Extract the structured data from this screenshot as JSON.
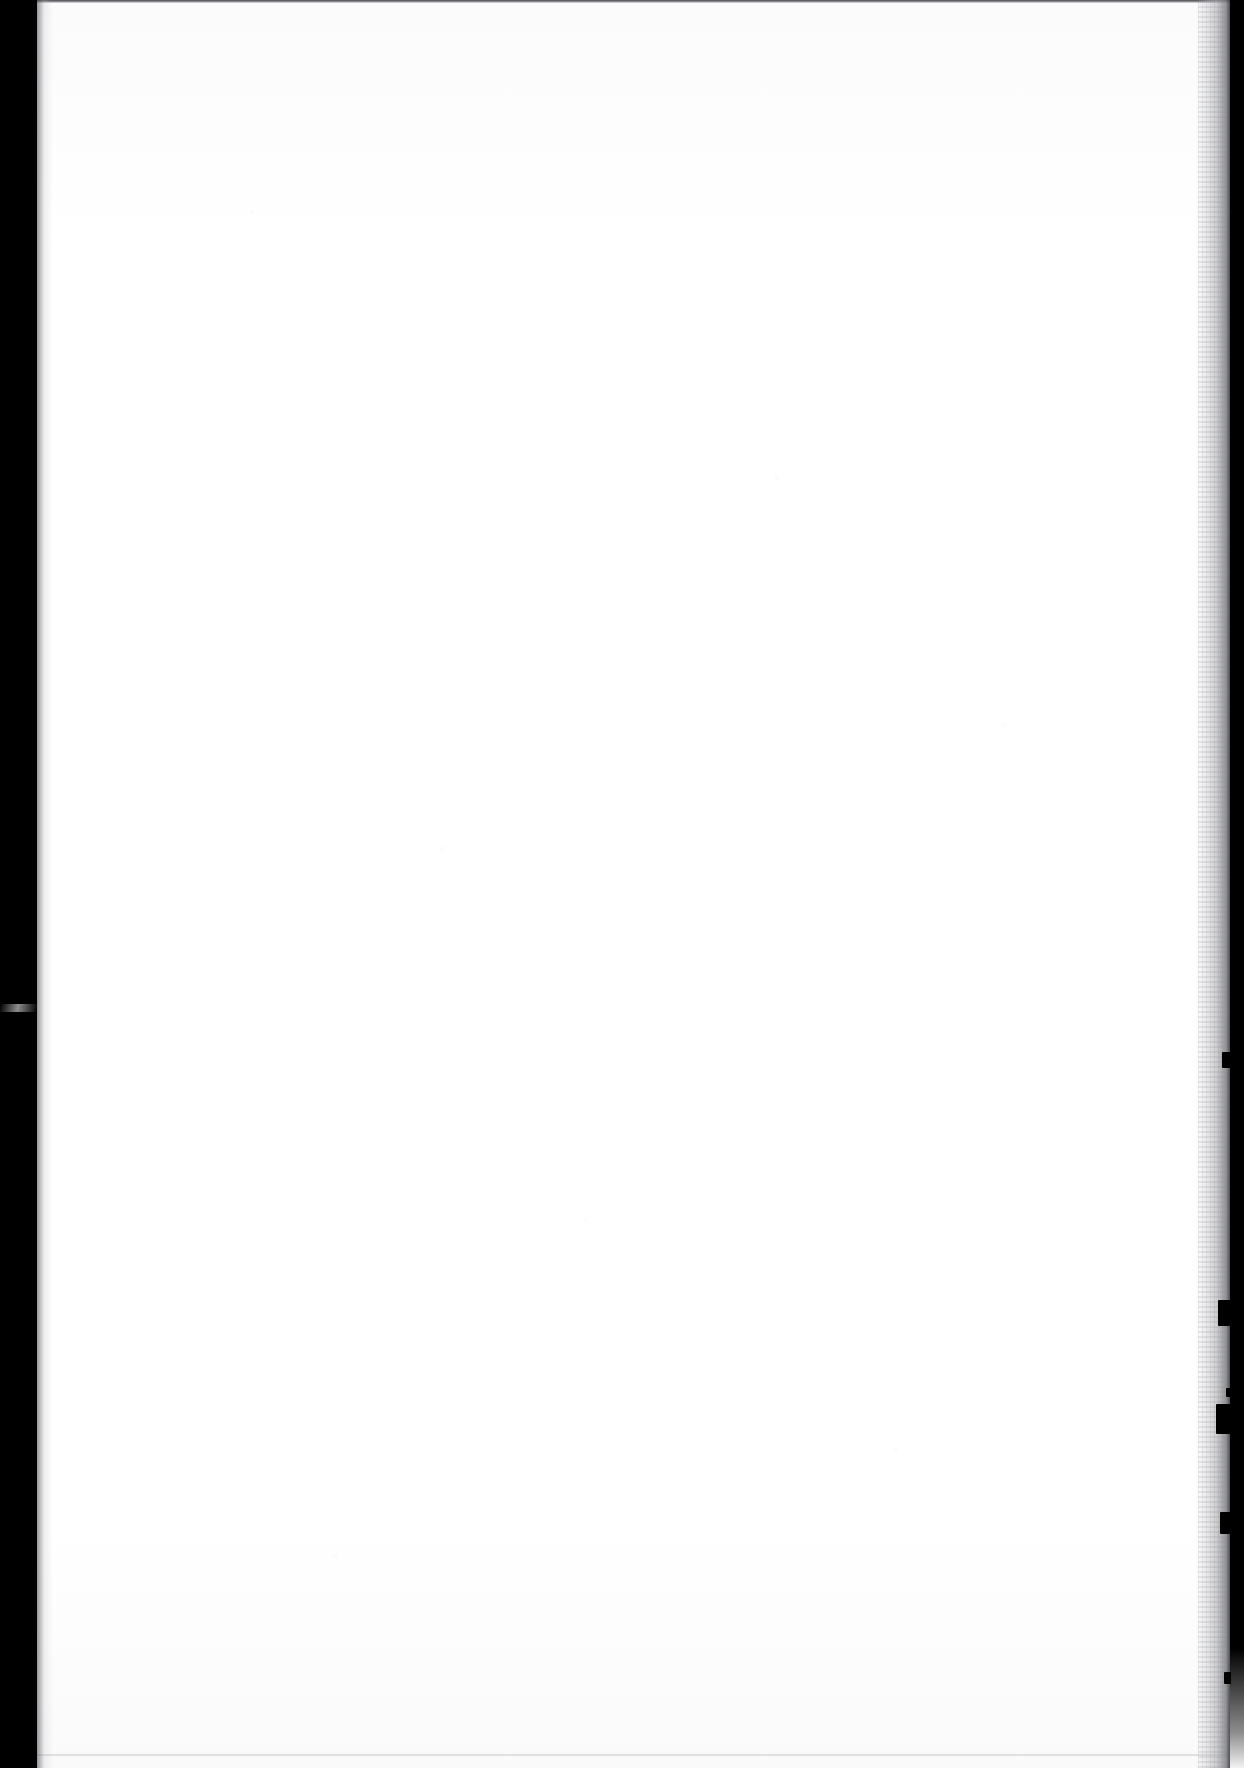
{
  "document": {
    "kind": "scanned-page-image",
    "page_state": "blank",
    "visible_text": "",
    "orientation": "portrait",
    "canvas": {
      "width_px": 1244,
      "height_px": 1768
    }
  },
  "paper": {
    "label": "",
    "surface_color": "#fdfdfd",
    "tint_top": "#fbfbfc",
    "tint_bottom": "#fafafb",
    "content_area": {
      "left_px": 97,
      "right_px": 1170,
      "top_px": 90,
      "bottom_px": 1678,
      "ink_marks": 0
    }
  },
  "gutters": {
    "left": {
      "label": "",
      "color": "#000000",
      "width_px": 37,
      "edge_x_px": 37
    },
    "right": {
      "label": "",
      "color": "#000000",
      "width_px": 14,
      "edge_x_px": 1230,
      "fade_start_y_px": 1648
    }
  },
  "artifacts": {
    "top_rule": {
      "label": "",
      "color": "#4a4a4c",
      "y_px": 0,
      "thickness_px": 3
    },
    "bottom_rule": {
      "label": "",
      "color": "#cdced1",
      "y_px": 1754,
      "thickness_px": 2
    },
    "right_shadow": {
      "label": "",
      "color": "#acadb2",
      "start_x_px": 1196,
      "end_x_px": 1230
    },
    "left_shadow": {
      "label": "",
      "color": "#46464a"
    },
    "left_seam": {
      "label": "",
      "y_px": 1004,
      "height_px": 8
    },
    "edge_nicks": [
      {
        "label": "",
        "x_px": 1222,
        "y_px": 1052,
        "width_px": 9,
        "height_px": 16
      },
      {
        "label": "",
        "x_px": 1218,
        "y_px": 1300,
        "width_px": 13,
        "height_px": 26
      },
      {
        "label": "",
        "x_px": 1216,
        "y_px": 1404,
        "width_px": 15,
        "height_px": 30
      },
      {
        "label": "",
        "x_px": 1220,
        "y_px": 1512,
        "width_px": 11,
        "height_px": 22
      },
      {
        "label": "",
        "x_px": 1224,
        "y_px": 1672,
        "width_px": 7,
        "height_px": 12
      },
      {
        "label": "",
        "x_px": 1226,
        "y_px": 1388,
        "width_px": 5,
        "height_px": 9
      }
    ]
  }
}
